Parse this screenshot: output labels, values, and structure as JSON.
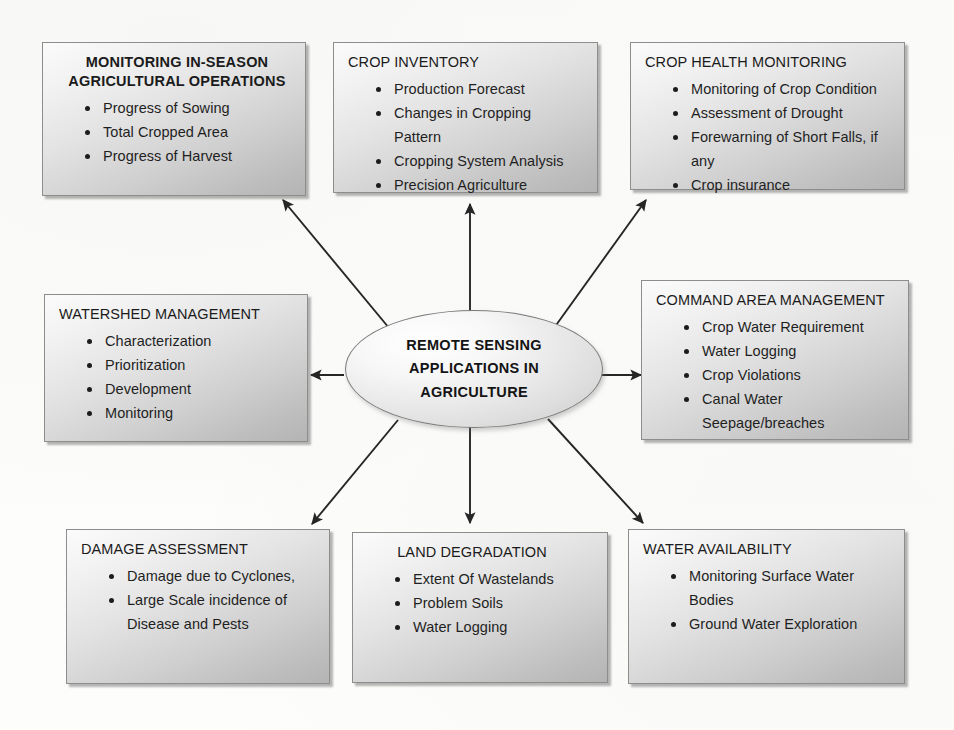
{
  "center": {
    "name": "remote-sensing-applications-in-agriculture",
    "lines": [
      "REMOTE SENSING",
      "APPLICATIONS IN",
      "AGRICULTURE"
    ]
  },
  "boxes": [
    {
      "id": "monitoring-in-season-agricultural-operations",
      "title_lines": [
        "MONITORING IN-SEASON",
        "AGRICULTURAL OPERATIONS"
      ],
      "title": "MONITORING IN-SEASON AGRICULTURAL OPERATIONS",
      "bold": true,
      "items": [
        "Progress of Sowing",
        "Total Cropped Area",
        "Progress of Harvest"
      ]
    },
    {
      "id": "crop-inventory",
      "title": "CROP INVENTORY",
      "bold": false,
      "items": [
        "Production Forecast",
        "Changes in Cropping",
        "Pattern",
        "Cropping System Analysis",
        "Precision Agriculture"
      ],
      "continuation_indices": [
        2
      ]
    },
    {
      "id": "crop-health-monitoring",
      "title": "CROP HEALTH MONITORING",
      "bold": false,
      "items": [
        "Monitoring of Crop Condition",
        "Assessment of Drought",
        "Forewarning of Short Falls, if",
        "any",
        "Crop insurance"
      ],
      "continuation_indices": [
        3
      ]
    },
    {
      "id": "watershed-management",
      "title": "WATERSHED MANAGEMENT",
      "bold": false,
      "items": [
        "Characterization",
        "Prioritization",
        "Development",
        "Monitoring"
      ]
    },
    {
      "id": "command-area-management",
      "title": "COMMAND AREA MANAGEMENT",
      "bold": false,
      "items": [
        "Crop Water Requirement",
        "Water Logging",
        "Crop Violations",
        "Canal Water",
        "Seepage/breaches"
      ],
      "continuation_indices": [
        4
      ]
    },
    {
      "id": "damage-assessment",
      "title": "DAMAGE ASSESSMENT",
      "bold": false,
      "items": [
        "Damage due to Cyclones,",
        "Large Scale incidence of",
        "Disease and Pests"
      ],
      "continuation_indices": [
        2
      ]
    },
    {
      "id": "land-degradation",
      "title": "LAND DEGRADATION",
      "bold": false,
      "items": [
        "Extent Of Wastelands",
        "Problem Soils",
        "Water Logging"
      ]
    },
    {
      "id": "water-availability",
      "title": "WATER AVAILABILITY",
      "bold": false,
      "items": [
        "Monitoring Surface Water",
        "Bodies",
        "Ground Water Exploration"
      ],
      "continuation_indices": [
        1
      ]
    }
  ],
  "colors": {
    "box_border": "#8d8d8d",
    "box_fill_light": "#fbfbfb",
    "box_fill_dark": "#b4b4b4",
    "arrow": "#262626",
    "text": "#1f1f1f",
    "page_background": "#fdfdfc"
  },
  "arrows": [
    {
      "id": "arrow-to-monitoring-in-season",
      "direction": "up-left"
    },
    {
      "id": "arrow-to-crop-inventory",
      "direction": "up"
    },
    {
      "id": "arrow-to-crop-health-monitoring",
      "direction": "up-right"
    },
    {
      "id": "arrow-to-watershed-management",
      "direction": "left"
    },
    {
      "id": "arrow-to-command-area-management",
      "direction": "right"
    },
    {
      "id": "arrow-to-damage-assessment",
      "direction": "down-left"
    },
    {
      "id": "arrow-to-land-degradation",
      "direction": "down"
    },
    {
      "id": "arrow-to-water-availability",
      "direction": "down-right"
    }
  ]
}
